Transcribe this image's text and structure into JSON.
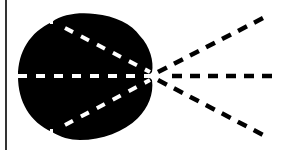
{
  "diagram": {
    "colors": {
      "background": "#ffffff",
      "lobe": "#000000",
      "rays_inside": "#ffffff",
      "rays_outside": "#000000",
      "border_line": "#000000"
    },
    "border_line": {
      "x": 6,
      "y1": 0,
      "y2": 150
    },
    "focal_point": {
      "x": 153,
      "y": 76
    },
    "rays": [
      {
        "name": "upper",
        "start": [
          65,
          28
        ],
        "end": [
          269,
          15
        ]
      },
      {
        "name": "center",
        "start": [
          18,
          76
        ],
        "end": [
          279,
          76
        ]
      },
      {
        "name": "lower",
        "start": [
          65,
          125
        ],
        "end": [
          267,
          137
        ]
      }
    ]
  }
}
